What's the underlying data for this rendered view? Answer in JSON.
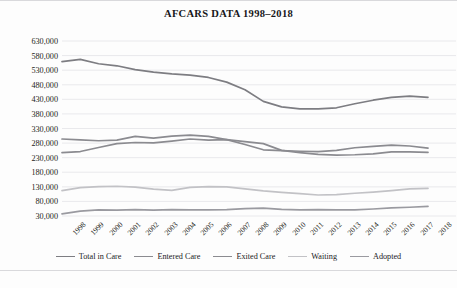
{
  "chart_data": {
    "type": "line",
    "title": "AFCARS DATA 1998–2018",
    "xlabel": "",
    "ylabel": "",
    "grid": true,
    "legend_position": "bottom",
    "ylim": [
      30000,
      630000
    ],
    "ytick_step": 50000,
    "ytick_labels": [
      "630,000",
      "580,000",
      "530,000",
      "480,000",
      "430,000",
      "380,000",
      "330,000",
      "280,000",
      "230,000",
      "180,000",
      "130,000",
      "80,000",
      "30,000"
    ],
    "ytick_values": [
      630000,
      580000,
      530000,
      480000,
      430000,
      380000,
      330000,
      280000,
      230000,
      180000,
      130000,
      80000,
      30000
    ],
    "categories": [
      "1998",
      "1999",
      "2000",
      "2001",
      "2002",
      "2003",
      "2004",
      "2005",
      "2006",
      "2007",
      "2008",
      "2009",
      "2010",
      "2011",
      "2012",
      "2013",
      "2014",
      "2015",
      "2016",
      "2017",
      "2018"
    ],
    "series": [
      {
        "name": "Total in Care",
        "color": "#7d7d82",
        "values": [
          559000,
          567000,
          552000,
          545000,
          532000,
          523000,
          517000,
          513000,
          505000,
          489000,
          463000,
          423000,
          404000,
          397000,
          397000,
          401000,
          415000,
          427000,
          437000,
          441000,
          437000
        ]
      },
      {
        "name": "Entered Care",
        "color": "#8b8b90",
        "values": [
          294000,
          291000,
          288000,
          290000,
          303000,
          297000,
          304000,
          307000,
          303000,
          292000,
          275000,
          257000,
          254000,
          252000,
          251000,
          255000,
          264000,
          269000,
          273000,
          270000,
          263000
        ]
      },
      {
        "name": "Exited Care",
        "color": "#8b8b90",
        "values": [
          247000,
          251000,
          265000,
          278000,
          282000,
          281000,
          287000,
          294000,
          290000,
          292000,
          285000,
          278000,
          255000,
          247000,
          241000,
          239000,
          240000,
          243000,
          250000,
          250000,
          248000
        ]
      },
      {
        "name": "Waiting",
        "color": "#c2c2c6",
        "values": [
          117000,
          127000,
          131000,
          132000,
          129000,
          122000,
          118000,
          128000,
          131000,
          130000,
          123000,
          116000,
          111000,
          107000,
          102000,
          103000,
          108000,
          112000,
          117000,
          123000,
          125000
        ]
      },
      {
        "name": "Adopted",
        "color": "#9a9aa0",
        "values": [
          37000,
          47000,
          51000,
          50000,
          52000,
          50000,
          52000,
          51000,
          51000,
          52000,
          55000,
          57000,
          53000,
          51000,
          52000,
          51000,
          51000,
          54000,
          58000,
          60000,
          63000
        ]
      }
    ]
  }
}
